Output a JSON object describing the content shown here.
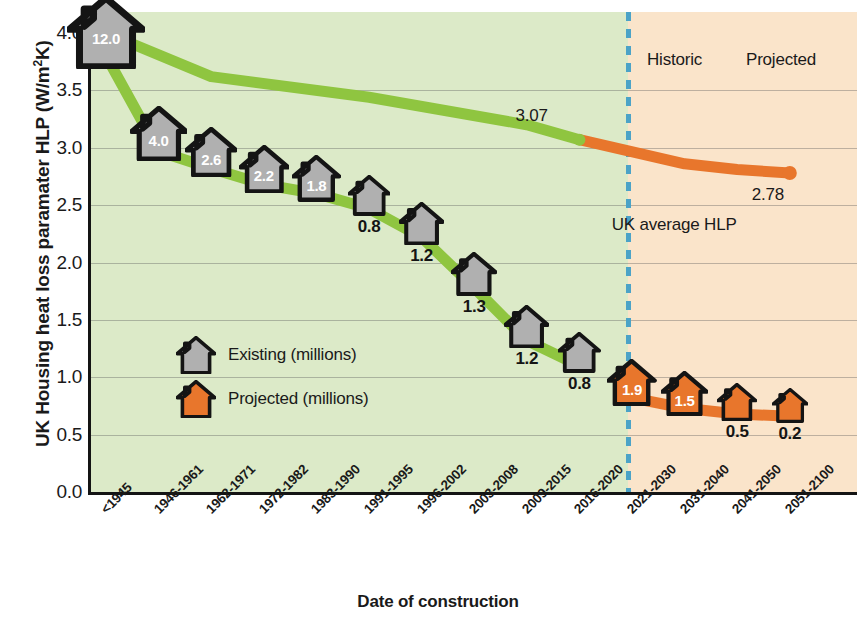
{
  "chart_data": {
    "type": "line",
    "title": "",
    "xlabel": "Date of construction",
    "ylabel": "UK Housing heat loss paramater HLP (W/m²K)",
    "ylim": [
      0.0,
      4.0
    ],
    "yticks": [
      "0.0",
      "0.5",
      "1.0",
      "1.5",
      "2.0",
      "2.5",
      "3.0",
      "3.5",
      "4.0"
    ],
    "grid": true,
    "legend_position": "inside-left",
    "categories": [
      "<1945",
      "1946-1961",
      "1962-1971",
      "1972-1982",
      "1983-1990",
      "1991-1995",
      "1996-2002",
      "2003-2008",
      "2009-2015",
      "2016-2020",
      "2021-2030",
      "2031-2040",
      "2041-2050",
      "2051-2100"
    ],
    "series": [
      {
        "name": "Existing (millions)",
        "color": "#8fc540",
        "house_fill": "#b0b0b0",
        "kind": "existing",
        "hlp": [
          3.8,
          2.97,
          2.82,
          2.68,
          2.6,
          2.47,
          2.22,
          1.78,
          1.32,
          1.1
        ],
        "stock_labels": [
          "12.0",
          "4.0",
          "2.6",
          "2.2",
          "1.8",
          "0.8",
          "1.2",
          "1.3",
          "1.2",
          "0.8"
        ],
        "stock_values": [
          12.0,
          4.0,
          2.6,
          2.2,
          1.8,
          0.8,
          1.2,
          1.3,
          1.2,
          0.8
        ]
      },
      {
        "name": "Projected (millions)",
        "color": "#e8762c",
        "house_fill": "#e8762c",
        "kind": "projected",
        "hlp": [
          0.82,
          0.73,
          0.68,
          0.66
        ],
        "stock_labels": [
          "1.9",
          "1.5",
          "0.5",
          "0.2"
        ],
        "stock_values": [
          1.9,
          1.5,
          0.5,
          0.2
        ]
      }
    ],
    "average_line": {
      "name": "UK average HLP",
      "historic_color": "#8fc540",
      "projected_color": "#e8762c",
      "start_value": 4.0,
      "junction_value": 3.07,
      "junction_label": "3.07",
      "end_value": 2.78,
      "end_label": "2.78",
      "caption": "UK average HLP"
    },
    "zones": [
      {
        "label": "Historic",
        "side": "left",
        "background": "#dceac8"
      },
      {
        "label": "Projected",
        "side": "right",
        "background": "#fae4ca"
      }
    ],
    "divider": {
      "color": "#4ba3c7",
      "style": "dashed",
      "at_category": "2016-2020 / 2021-2030"
    }
  },
  "legend": {
    "items": [
      {
        "label": "Existing (millions)",
        "swatch": "house-grey-icon",
        "color": "#b0b0b0"
      },
      {
        "label": "Projected (millions)",
        "swatch": "house-orange-icon",
        "color": "#e8762c"
      }
    ]
  },
  "colors": {
    "green": "#8fc540",
    "orange": "#e8762c",
    "grey_house": "#b0b0b0",
    "outline": "#141414",
    "historic_band": "#dceac8",
    "projected_band": "#fae4ca",
    "divider_blue": "#4ba3c7"
  }
}
